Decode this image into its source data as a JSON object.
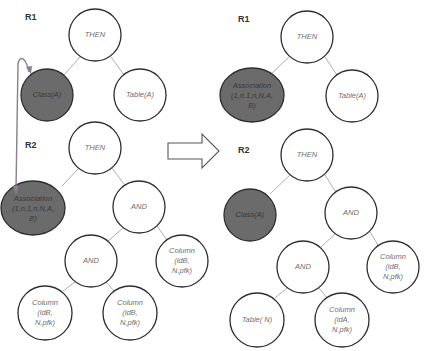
{
  "diagram": {
    "type": "rule-transformation-trees",
    "colors": {
      "background": "#ffffff",
      "node_fill": "#ffffff",
      "highlight_fill": "#6b6b6b",
      "node_stroke": "#2e2e2e",
      "edge": "#b0b0b0",
      "connector": "#8a7f8e"
    },
    "before": {
      "r1": {
        "label": "R1",
        "nodes": {
          "then": "THEN",
          "class": "Class(A)",
          "table": "Table(A)"
        }
      },
      "r2": {
        "label": "R2",
        "nodes": {
          "then": "THEN",
          "association": [
            "Association",
            "(1,n,1,n,N,A,",
            "B)"
          ],
          "and_upper": "AND",
          "and_lower": "AND",
          "column_right": [
            "Column",
            "(idB,",
            "N,pfk)"
          ],
          "column_bottom_left": [
            "Column",
            "(idB,",
            "N,pfk)"
          ],
          "column_bottom_mid": [
            "Column",
            "(idB,",
            "N,pfk)"
          ]
        }
      }
    },
    "transform_arrow": "right-arrow",
    "after": {
      "r1": {
        "label": "R1",
        "nodes": {
          "then": "THEN",
          "association": [
            "Association",
            "(1,n,1,n,N,A,",
            "B)"
          ],
          "table": "Table(A)"
        }
      },
      "r2": {
        "label": "R2",
        "nodes": {
          "then": "THEN",
          "class": "Class(A)",
          "and_upper": "AND",
          "and_lower": "AND",
          "column_right": [
            "Column",
            "(idB,",
            "N,pfk)"
          ],
          "table_bottom": "Table( N)",
          "column_bottom": [
            "Column",
            "(idA,",
            "N,pfk)"
          ]
        }
      }
    }
  }
}
